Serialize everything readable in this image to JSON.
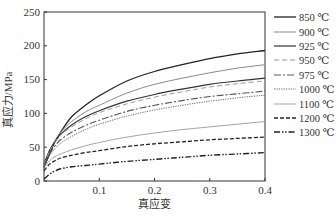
{
  "chart_data": {
    "type": "line",
    "title": "",
    "xlabel": "真应变",
    "ylabel": "真应力/MPa",
    "xlim": [
      0,
      0.4
    ],
    "ylim": [
      0,
      250
    ],
    "xticks": [
      0.1,
      0.2,
      0.3,
      0.4
    ],
    "xtick_labels": [
      "0.1",
      "0.2",
      "0.3",
      "0.4"
    ],
    "yticks": [
      0,
      50,
      100,
      150,
      200,
      250
    ],
    "ytick_labels": [
      "0",
      "50",
      "100",
      "150",
      "200",
      "250"
    ],
    "grid": false,
    "legend_position": "right",
    "x": [
      0,
      0.01,
      0.02,
      0.03,
      0.05,
      0.075,
      0.1,
      0.15,
      0.2,
      0.25,
      0.3,
      0.35,
      0.4
    ],
    "series": [
      {
        "name": "850 ℃",
        "style": "solid",
        "color": "#222222",
        "width": 1.3,
        "values": [
          20,
          40,
          58,
          72,
          95,
          112,
          126,
          148,
          162,
          172,
          181,
          188,
          193
        ]
      },
      {
        "name": "900 ℃",
        "style": "solid",
        "color": "#8a8a8a",
        "width": 1.0,
        "values": [
          25,
          45,
          60,
          72,
          88,
          102,
          112,
          130,
          143,
          152,
          160,
          167,
          172
        ]
      },
      {
        "name": "925 ℃",
        "style": "solid",
        "color": "#333333",
        "width": 1.2,
        "values": [
          25,
          45,
          58,
          69,
          83,
          95,
          104,
          118,
          128,
          136,
          143,
          148,
          152
        ]
      },
      {
        "name": "950 ℃",
        "style": "dashed-light",
        "color": "#9a9a9a",
        "width": 1.0,
        "values": [
          24,
          44,
          57,
          68,
          80,
          92,
          101,
          114,
          124,
          132,
          139,
          144,
          148
        ]
      },
      {
        "name": "975 ℃",
        "style": "dashdot",
        "color": "#555555",
        "width": 1.1,
        "values": [
          22,
          40,
          52,
          61,
          72,
          82,
          90,
          103,
          112,
          119,
          125,
          129,
          133
        ]
      },
      {
        "name": "1000 ℃",
        "style": "dotted",
        "color": "#555555",
        "width": 0.9,
        "values": [
          20,
          37,
          48,
          56,
          66,
          76,
          84,
          96,
          105,
          112,
          118,
          123,
          127
        ]
      },
      {
        "name": "1100 ℃",
        "style": "solid-thin",
        "color": "#999999",
        "width": 0.9,
        "values": [
          20,
          30,
          36,
          40,
          46,
          52,
          57,
          65,
          71,
          76,
          80,
          84,
          88
        ]
      },
      {
        "name": "1200 ℃",
        "style": "dashed",
        "color": "#222222",
        "width": 1.3,
        "values": [
          15,
          25,
          30,
          34,
          38,
          42,
          45,
          51,
          55,
          58,
          61,
          63,
          65
        ]
      },
      {
        "name": "1300 ℃",
        "style": "dashdotdot",
        "color": "#222222",
        "width": 1.4,
        "values": [
          3,
          10,
          15,
          18,
          21,
          23,
          25,
          29,
          32,
          35,
          38,
          40,
          42
        ]
      }
    ]
  }
}
